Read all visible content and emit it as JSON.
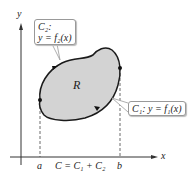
{
  "diagram": {
    "axes": {
      "x_label": "x",
      "y_label": "y"
    },
    "region_label": "R",
    "tick_labels": {
      "a": "a",
      "b": "b"
    },
    "caption": "C = C₁ + C₂",
    "callouts": {
      "c2_line1": "C₂:",
      "c2_line2": "y = f₂(x)",
      "c1": "C₁: y = f₁(x)"
    },
    "colors": {
      "region_fill": "#d3d3d3",
      "curve": "#1a1a1a",
      "axis": "#333333"
    }
  }
}
